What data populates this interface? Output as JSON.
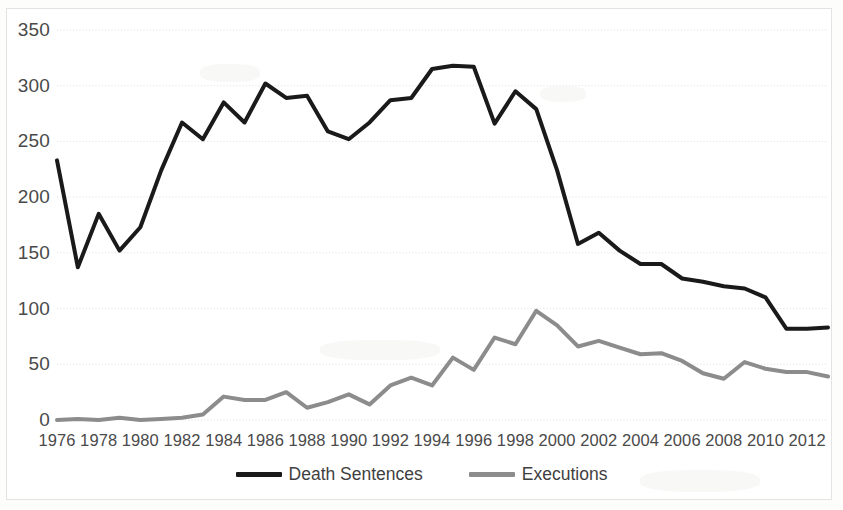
{
  "chart_data": {
    "type": "line",
    "title": "",
    "subtitle": "",
    "xlabel": "",
    "ylabel": "",
    "xlim": [
      1976,
      2013
    ],
    "ylim": [
      0,
      350
    ],
    "grid": true,
    "grid_axis": "y",
    "legend_position": "bottom-center",
    "x": [
      1976,
      1977,
      1978,
      1979,
      1980,
      1981,
      1982,
      1983,
      1984,
      1985,
      1986,
      1987,
      1988,
      1989,
      1990,
      1991,
      1992,
      1993,
      1994,
      1995,
      1996,
      1997,
      1998,
      1999,
      2000,
      2001,
      2002,
      2003,
      2004,
      2005,
      2006,
      2007,
      2008,
      2009,
      2010,
      2011,
      2012,
      2013
    ],
    "xtick_labels": [
      "1976",
      "1978",
      "1980",
      "1982",
      "1984",
      "1986",
      "1988",
      "1990",
      "1992",
      "1994",
      "1996",
      "1998",
      "2000",
      "2002",
      "2004",
      "2006",
      "2008",
      "2010",
      "2012"
    ],
    "xtick_values": [
      1976,
      1978,
      1980,
      1982,
      1984,
      1986,
      1988,
      1990,
      1992,
      1994,
      1996,
      1998,
      2000,
      2002,
      2004,
      2006,
      2008,
      2010,
      2012
    ],
    "ytick_labels": [
      "350",
      "300",
      "250",
      "200",
      "150",
      "100",
      "50",
      "0"
    ],
    "ytick_values": [
      350,
      300,
      250,
      200,
      150,
      100,
      50,
      0
    ],
    "series": [
      {
        "name": "Death Sentences",
        "color": "#1a1a1a",
        "line_width": 4,
        "values": [
          233,
          137,
          185,
          152,
          173,
          224,
          267,
          252,
          285,
          267,
          302,
          289,
          291,
          259,
          252,
          267,
          287,
          289,
          315,
          318,
          317,
          266,
          295,
          279,
          224,
          158,
          168,
          152,
          140,
          140,
          127,
          124,
          120,
          118,
          110,
          82,
          82,
          83
        ]
      },
      {
        "name": "Executions",
        "color": "#8c8c8c",
        "line_width": 4,
        "values": [
          0,
          1,
          0,
          2,
          0,
          1,
          2,
          5,
          21,
          18,
          18,
          25,
          11,
          16,
          23,
          14,
          31,
          38,
          31,
          56,
          45,
          74,
          68,
          98,
          85,
          66,
          71,
          65,
          59,
          60,
          53,
          42,
          37,
          52,
          46,
          43,
          43,
          39
        ]
      }
    ]
  },
  "legend": {
    "items": [
      {
        "label": "Death Sentences",
        "color": "#1a1a1a"
      },
      {
        "label": "Executions",
        "color": "#8c8c8c"
      }
    ]
  }
}
